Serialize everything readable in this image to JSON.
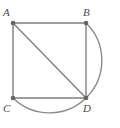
{
  "figure": {
    "type": "geometry-diagram",
    "width": 120,
    "height": 128,
    "background_color": "#ffffff",
    "stroke_color": "#808080",
    "vertex_dot_color": "#666666",
    "label_color": "#4a4a4a",
    "stroke_width": 1.4,
    "vertex_dot_radius": 2.3
  },
  "points": [
    {
      "id": "A",
      "label": "A",
      "x": 13,
      "y": 23,
      "label_x": 3,
      "label_y": 7
    },
    {
      "id": "B",
      "label": "B",
      "x": 86,
      "y": 23,
      "label_x": 83,
      "label_y": 7
    },
    {
      "id": "C",
      "label": "C",
      "x": 13,
      "y": 98,
      "label_x": 3,
      "label_y": 103
    },
    {
      "id": "D",
      "label": "D",
      "x": 86,
      "y": 98,
      "label_x": 83,
      "label_y": 103
    }
  ],
  "segments": [
    {
      "id": "AB",
      "name": "segment-ab",
      "from": "A",
      "to": "B",
      "x1": 13,
      "y1": 23,
      "x2": 86,
      "y2": 23
    },
    {
      "id": "AC",
      "name": "segment-ac",
      "from": "A",
      "to": "C",
      "x1": 13,
      "y1": 23,
      "x2": 13,
      "y2": 98
    },
    {
      "id": "BD",
      "name": "segment-bd",
      "from": "B",
      "to": "D",
      "x1": 86,
      "y1": 23,
      "x2": 86,
      "y2": 98
    },
    {
      "id": "CD",
      "name": "segment-cd",
      "from": "C",
      "to": "D",
      "x1": 13,
      "y1": 98,
      "x2": 86,
      "y2": 98
    },
    {
      "id": "AD",
      "name": "diagonal-ad",
      "from": "A",
      "to": "D",
      "x1": 13,
      "y1": 23,
      "x2": 86,
      "y2": 98
    }
  ],
  "arc": {
    "id": "arc-BC",
    "name": "arc-b-to-c",
    "from": "B",
    "to": "C",
    "path": "M 86 23 A 52 52 0 1 1 13 98",
    "radius": 52,
    "large_arc": 1,
    "sweep": 1
  }
}
